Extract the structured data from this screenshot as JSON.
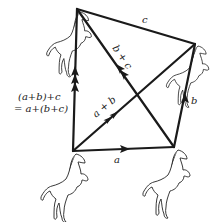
{
  "diagram": {
    "points": {
      "origin": {
        "x": 73,
        "y": 151
      },
      "after_a": {
        "x": 174,
        "y": 147
      },
      "after_ab": {
        "x": 195,
        "y": 44
      },
      "after_abc": {
        "x": 77,
        "y": 9
      }
    },
    "vectors": [
      {
        "id": "a",
        "label": "a",
        "from": "origin",
        "to": "after_a",
        "arrows": 1
      },
      {
        "id": "b",
        "label": "b",
        "from": "after_a",
        "to": "after_ab",
        "arrows": 1
      },
      {
        "id": "c",
        "label": "c",
        "from": "after_ab",
        "to": "after_abc",
        "arrows": 0
      },
      {
        "id": "a_plus_b",
        "label": "a + b",
        "from": "origin",
        "to": "after_ab",
        "arrows": 2
      },
      {
        "id": "b_plus_c",
        "label": "b + c",
        "from": "after_a",
        "to": "after_abc",
        "arrows": 2
      },
      {
        "id": "sum",
        "label": "(a+b)+c = a+(b+c)",
        "from": "origin",
        "to": "after_abc",
        "arrows": 3
      }
    ],
    "labels": {
      "a": "a",
      "b": "b",
      "c": "c",
      "a_plus_b": "a + b",
      "b_plus_c": "b + c",
      "sum_line1": "(a+b)+c",
      "sum_line2": "= a+(b+c)"
    },
    "figures": [
      {
        "name": "horse-origin",
        "at": "origin"
      },
      {
        "name": "horse-after-a",
        "at": "after_a"
      },
      {
        "name": "horse-after-ab",
        "at": "after_ab"
      },
      {
        "name": "horse-after-abc",
        "at": "after_abc"
      }
    ],
    "colors": {
      "ink": "#1a1a1a",
      "background": "#ffffff"
    }
  }
}
